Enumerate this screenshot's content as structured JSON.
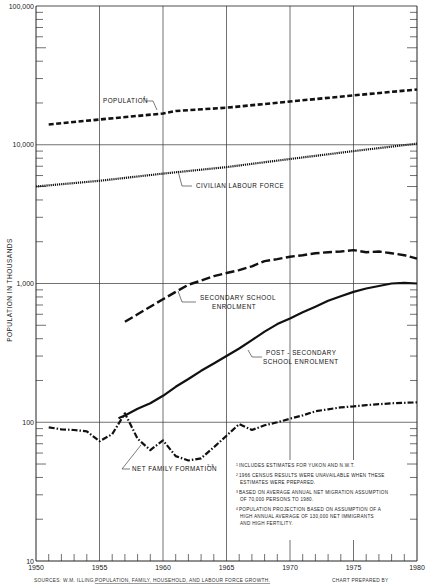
{
  "chart_data": {
    "type": "line",
    "title": "",
    "xlabel": "",
    "ylabel": "POPULATION IN THOUSANDS",
    "yscale": "log",
    "xlim": [
      1950,
      1980
    ],
    "ylim": [
      10,
      100000
    ],
    "grid": true,
    "x_ticks": [
      "1950",
      "1955",
      "1960",
      "1965",
      "1970",
      "1975",
      "1980"
    ],
    "y_ticks": [
      "10",
      "100",
      "1,000",
      "10,000",
      "100,000"
    ],
    "series": [
      {
        "name": "POPULATION",
        "superscript": "4",
        "style": "dashed",
        "points": [
          [
            1951,
            14000
          ],
          [
            1955,
            15200
          ],
          [
            1960,
            16800
          ],
          [
            1961,
            17500
          ],
          [
            1965,
            18500
          ],
          [
            1970,
            20500
          ],
          [
            1975,
            22700
          ],
          [
            1980,
            25000
          ]
        ]
      },
      {
        "name": "CIVILIAN LABOUR FORCE",
        "superscript": "",
        "style": "dotted",
        "points": [
          [
            1950,
            5000
          ],
          [
            1955,
            5500
          ],
          [
            1960,
            6200
          ],
          [
            1965,
            6900
          ],
          [
            1970,
            7900
          ],
          [
            1975,
            9000
          ],
          [
            1980,
            10200
          ]
        ]
      },
      {
        "name": "SECONDARY SCHOOL ENROLMENT",
        "superscript": "",
        "style": "long-dash",
        "points": [
          [
            1957,
            530
          ],
          [
            1958,
            600
          ],
          [
            1959,
            680
          ],
          [
            1960,
            770
          ],
          [
            1961,
            870
          ],
          [
            1962,
            980
          ],
          [
            1963,
            1050
          ],
          [
            1964,
            1130
          ],
          [
            1965,
            1190
          ],
          [
            1966,
            1250
          ],
          [
            1967,
            1330
          ],
          [
            1968,
            1450
          ],
          [
            1969,
            1500
          ],
          [
            1970,
            1560
          ],
          [
            1971,
            1600
          ],
          [
            1972,
            1650
          ],
          [
            1973,
            1680
          ],
          [
            1974,
            1700
          ],
          [
            1975,
            1740
          ],
          [
            1976,
            1680
          ],
          [
            1977,
            1700
          ],
          [
            1978,
            1650
          ],
          [
            1979,
            1600
          ],
          [
            1980,
            1510
          ]
        ]
      },
      {
        "name": "POST-SECONDARY SCHOOL ENROLMENT",
        "superscript": "",
        "style": "solid",
        "points": [
          [
            1956.5,
            107
          ],
          [
            1957,
            112
          ],
          [
            1958,
            125
          ],
          [
            1959,
            137
          ],
          [
            1960,
            155
          ],
          [
            1961,
            180
          ],
          [
            1962,
            205
          ],
          [
            1963,
            235
          ],
          [
            1964,
            265
          ],
          [
            1965,
            300
          ],
          [
            1966,
            340
          ],
          [
            1967,
            390
          ],
          [
            1968,
            450
          ],
          [
            1969,
            510
          ],
          [
            1970,
            560
          ],
          [
            1971,
            620
          ],
          [
            1972,
            680
          ],
          [
            1973,
            750
          ],
          [
            1974,
            810
          ],
          [
            1975,
            870
          ],
          [
            1976,
            920
          ],
          [
            1977,
            960
          ],
          [
            1978,
            1000
          ],
          [
            1979,
            1010
          ],
          [
            1980,
            1000
          ]
        ]
      },
      {
        "name": "NET FAMILY FORMATION",
        "superscript": "2,3",
        "style": "dash-dot",
        "points": [
          [
            1951,
            92
          ],
          [
            1952,
            89
          ],
          [
            1953,
            88
          ],
          [
            1954,
            86
          ],
          [
            1955,
            73
          ],
          [
            1956,
            82
          ],
          [
            1957,
            116
          ],
          [
            1958,
            76
          ],
          [
            1959,
            63
          ],
          [
            1960,
            74
          ],
          [
            1961,
            57
          ],
          [
            1962,
            53
          ],
          [
            1963,
            55
          ],
          [
            1964,
            66
          ],
          [
            1965,
            80
          ],
          [
            1966,
            97
          ],
          [
            1967,
            88
          ],
          [
            1968,
            95
          ],
          [
            1969,
            100
          ],
          [
            1970,
            106
          ],
          [
            1971,
            112
          ],
          [
            1972,
            120
          ],
          [
            1973,
            124
          ],
          [
            1974,
            128
          ],
          [
            1975,
            130
          ],
          [
            1976,
            133
          ],
          [
            1977,
            135
          ],
          [
            1978,
            137
          ],
          [
            1979,
            138
          ],
          [
            1980,
            139
          ]
        ]
      }
    ],
    "annotations": {
      "footnotes": [
        {
          "mark": "1",
          "lines": [
            "INCLUDES ESTIMATES FOR YUKON AND N.W.T."
          ]
        },
        {
          "mark": "2",
          "lines": [
            "1966 CENSUS RESULTS WERE UNAVAILABLE WHEN THESE",
            "ESTIMATES WERE PREPARED."
          ]
        },
        {
          "mark": "3",
          "lines": [
            "BASED ON AVERAGE ANNUAL NET MIGRATION ASSUMPTION",
            "OF 70,000 PERSONS TO 1980."
          ]
        },
        {
          "mark": "4",
          "lines": [
            "POPULATION PROJECTION BASED ON ASSUMPTION OF A",
            "HIGH ANNUAL AVERAGE OF 130,000 NET IMMIGRANTS",
            "AND HIGH FERTILITY."
          ]
        }
      ],
      "sources_prefix": "SOURCES:  W.M. ILLING,",
      "sources_title": "POPULATION, FAMILY, HOUSEHOLD, AND LABOUR FORCE GROWTH.",
      "chart_prepared_by": "CHART PREPARED BY"
    },
    "labels": {
      "population": "POPULATION",
      "population_sup": "4",
      "labour": "CIVILIAN LABOUR FORCE",
      "secondary_1": "SECONDARY SCHOOL",
      "secondary_2": "ENROLMENT",
      "post_1": "POST - SECONDARY",
      "post_2": "SCHOOL ENROLMENT",
      "nff": "NET FAMILY FORMATION",
      "nff_sup": "2,3"
    }
  }
}
